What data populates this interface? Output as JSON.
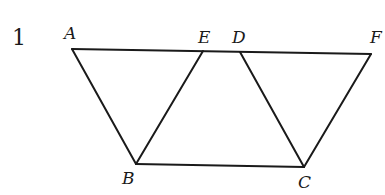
{
  "problem_number": "1",
  "points": {
    "A": {
      "label": "A",
      "x": 72,
      "y": 49
    },
    "E": {
      "label": "E",
      "x": 203,
      "y": 51
    },
    "D": {
      "label": "D",
      "x": 240,
      "y": 52
    },
    "F": {
      "label": "F",
      "x": 371,
      "y": 54
    },
    "B": {
      "label": "B",
      "x": 136,
      "y": 164
    },
    "C": {
      "label": "C",
      "x": 304,
      "y": 167
    }
  },
  "segments": [
    [
      "A",
      "F"
    ],
    [
      "A",
      "B"
    ],
    [
      "B",
      "E"
    ],
    [
      "B",
      "C"
    ],
    [
      "D",
      "C"
    ],
    [
      "C",
      "F"
    ]
  ],
  "colors": {
    "stroke": "#1a1a1a",
    "background": "#ffffff"
  }
}
